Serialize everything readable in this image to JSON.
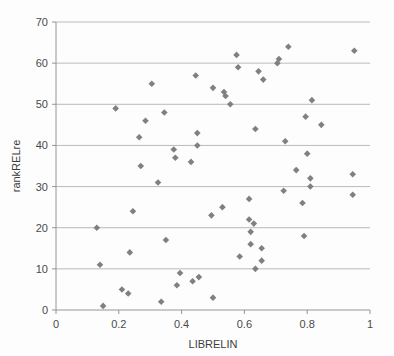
{
  "chart_data": {
    "type": "scatter",
    "title": "",
    "xlabel": "LIBRELIN",
    "ylabel": "rankRELre",
    "xlim": [
      0,
      1
    ],
    "ylim": [
      0,
      70
    ],
    "xticks": [
      0,
      0.2,
      0.4,
      0.6,
      0.8,
      1
    ],
    "xtick_labels": [
      "0",
      "0.2",
      "0.4",
      "0.6",
      "0.8",
      "1"
    ],
    "yticks": [
      0,
      10,
      20,
      30,
      40,
      50,
      60,
      70
    ],
    "ytick_labels": [
      "0",
      "10",
      "20",
      "30",
      "40",
      "50",
      "60",
      "70"
    ],
    "grid": "horizontal",
    "legend": "none",
    "marker": "diamond",
    "marker_color": "#808080",
    "series": [
      {
        "name": "rankRELre vs LIBRELIN",
        "points": [
          [
            0.13,
            20
          ],
          [
            0.14,
            11
          ],
          [
            0.15,
            1
          ],
          [
            0.19,
            49
          ],
          [
            0.21,
            5
          ],
          [
            0.23,
            4
          ],
          [
            0.235,
            14
          ],
          [
            0.245,
            24
          ],
          [
            0.265,
            42
          ],
          [
            0.27,
            35
          ],
          [
            0.285,
            46
          ],
          [
            0.305,
            55
          ],
          [
            0.325,
            31
          ],
          [
            0.335,
            2
          ],
          [
            0.345,
            48
          ],
          [
            0.35,
            17
          ],
          [
            0.375,
            39
          ],
          [
            0.38,
            37
          ],
          [
            0.385,
            6
          ],
          [
            0.395,
            9
          ],
          [
            0.43,
            36
          ],
          [
            0.435,
            7
          ],
          [
            0.445,
            57
          ],
          [
            0.45,
            40
          ],
          [
            0.45,
            43
          ],
          [
            0.455,
            8
          ],
          [
            0.495,
            23
          ],
          [
            0.5,
            54
          ],
          [
            0.5,
            3
          ],
          [
            0.53,
            25
          ],
          [
            0.535,
            53
          ],
          [
            0.54,
            52
          ],
          [
            0.555,
            50
          ],
          [
            0.575,
            62
          ],
          [
            0.58,
            59
          ],
          [
            0.585,
            13
          ],
          [
            0.615,
            22
          ],
          [
            0.615,
            27
          ],
          [
            0.62,
            19
          ],
          [
            0.62,
            16
          ],
          [
            0.63,
            21
          ],
          [
            0.635,
            10
          ],
          [
            0.635,
            44
          ],
          [
            0.645,
            58
          ],
          [
            0.655,
            15
          ],
          [
            0.655,
            12
          ],
          [
            0.66,
            56
          ],
          [
            0.705,
            60
          ],
          [
            0.71,
            61
          ],
          [
            0.725,
            29
          ],
          [
            0.73,
            41
          ],
          [
            0.74,
            64
          ],
          [
            0.765,
            34
          ],
          [
            0.785,
            26
          ],
          [
            0.79,
            18
          ],
          [
            0.795,
            47
          ],
          [
            0.8,
            38
          ],
          [
            0.81,
            30
          ],
          [
            0.81,
            32
          ],
          [
            0.815,
            51
          ],
          [
            0.845,
            45
          ],
          [
            0.945,
            28
          ],
          [
            0.945,
            33
          ],
          [
            0.95,
            63
          ]
        ]
      }
    ]
  }
}
